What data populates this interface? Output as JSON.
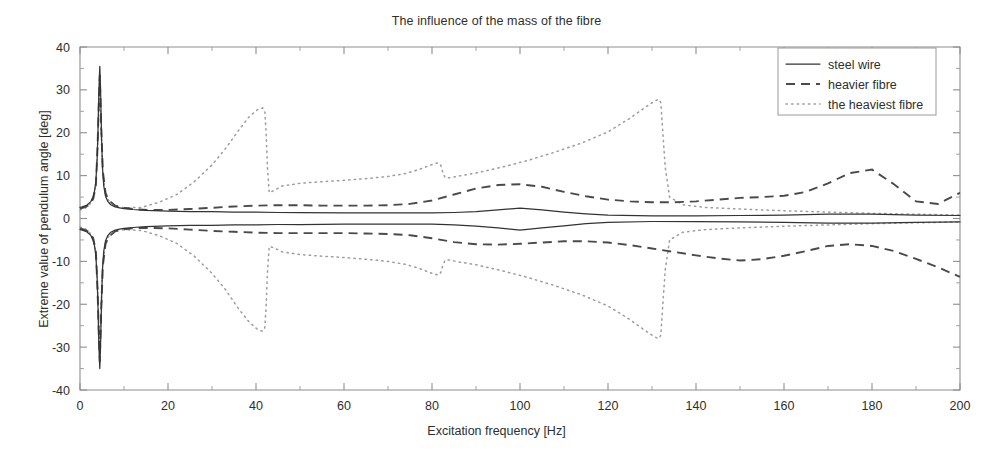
{
  "chart_data": {
    "type": "line",
    "title": "The influence of the mass of the fibre",
    "xlabel": "Excitation frequency [Hz]",
    "ylabel": "Extreme value of pendulum angle [deg]",
    "xlim": [
      0,
      200
    ],
    "ylim": [
      -40,
      40
    ],
    "xticks": [
      0,
      20,
      40,
      60,
      80,
      100,
      120,
      140,
      160,
      180,
      200
    ],
    "xtick_labels": [
      "0",
      "20",
      "40",
      "60",
      "80",
      "100",
      "120",
      "140",
      "160",
      "180",
      "200"
    ],
    "yticks": [
      -40,
      -30,
      -20,
      -10,
      0,
      10,
      20,
      30,
      40
    ],
    "ytick_labels": [
      "-40",
      "-30",
      "-20",
      "-10",
      "0",
      "10",
      "20",
      "30",
      "40"
    ],
    "grid": false,
    "legend_position": "top-right",
    "legend_entries": [
      {
        "label": "steel wire",
        "style": "solid",
        "color": "#333333"
      },
      {
        "label": "heavier fibre",
        "style": "dashed",
        "color": "#4a4a4a"
      },
      {
        "label": "the heaviest fibre",
        "style": "dotted",
        "color": "#9d9d9d"
      }
    ],
    "note": "Each fibre has an upper (maximum) and lower (minimum) extreme-value branch; all three share a sharp resonance spike near 4.5 Hz reaching about +-35 deg.",
    "series": [
      {
        "name": "steel wire",
        "branch": "upper",
        "style": "solid",
        "x": [
          0,
          0.5,
          1,
          1.5,
          2,
          2.5,
          3,
          3.3,
          3.6,
          3.9,
          4.1,
          4.3,
          4.5,
          4.7,
          4.9,
          5.1,
          5.4,
          5.8,
          6.3,
          7,
          8,
          9,
          10,
          12,
          15,
          20,
          25,
          30,
          35,
          40,
          45,
          50,
          60,
          70,
          80,
          85,
          90,
          95,
          100,
          105,
          110,
          115,
          120,
          130,
          140,
          150,
          160,
          170,
          180,
          190,
          200
        ],
        "y": [
          2.6,
          2.7,
          2.9,
          3.1,
          3.5,
          4.0,
          5.2,
          6.4,
          8.6,
          14.0,
          21.0,
          30.0,
          35.5,
          29.0,
          19.0,
          12.0,
          7.6,
          5.2,
          4.0,
          3.2,
          2.7,
          2.5,
          2.3,
          2.1,
          1.9,
          1.7,
          1.6,
          1.6,
          1.5,
          1.5,
          1.4,
          1.4,
          1.3,
          1.3,
          1.3,
          1.4,
          1.6,
          2.0,
          2.4,
          2.0,
          1.5,
          1.1,
          0.8,
          0.6,
          0.6,
          0.7,
          0.8,
          1.0,
          1.0,
          0.8,
          0.7
        ]
      },
      {
        "name": "steel wire",
        "branch": "lower",
        "style": "solid",
        "x": [
          0,
          0.5,
          1,
          1.5,
          2,
          2.5,
          3,
          3.3,
          3.6,
          3.9,
          4.1,
          4.3,
          4.5,
          4.7,
          4.9,
          5.1,
          5.4,
          5.8,
          6.3,
          7,
          8,
          9,
          10,
          12,
          15,
          20,
          25,
          30,
          35,
          40,
          45,
          50,
          60,
          70,
          80,
          85,
          90,
          95,
          100,
          105,
          110,
          115,
          120,
          130,
          140,
          150,
          160,
          170,
          180,
          190,
          200
        ],
        "y": [
          -2.6,
          -2.7,
          -2.9,
          -3.1,
          -3.5,
          -4.0,
          -5.2,
          -6.4,
          -8.6,
          -14.0,
          -21.0,
          -30.0,
          -35.0,
          -28.5,
          -19.0,
          -12.0,
          -7.6,
          -5.2,
          -4.0,
          -3.2,
          -2.7,
          -2.5,
          -2.3,
          -2.1,
          -1.9,
          -1.7,
          -1.6,
          -1.6,
          -1.5,
          -1.5,
          -1.4,
          -1.4,
          -1.3,
          -1.3,
          -1.3,
          -1.5,
          -1.8,
          -2.2,
          -2.7,
          -2.2,
          -1.7,
          -1.2,
          -0.9,
          -0.7,
          -0.7,
          -0.8,
          -0.9,
          -1.1,
          -1.1,
          -0.9,
          -0.8
        ]
      },
      {
        "name": "heavier fibre",
        "branch": "upper",
        "style": "dashed",
        "x": [
          0,
          1,
          2,
          3,
          3.6,
          4.0,
          4.3,
          4.5,
          4.8,
          5.2,
          5.8,
          6.5,
          8,
          10,
          13,
          16,
          20,
          25,
          30,
          35,
          40,
          45,
          50,
          55,
          60,
          65,
          70,
          75,
          80,
          85,
          90,
          95,
          100,
          105,
          110,
          115,
          120,
          125,
          130,
          135,
          140,
          145,
          150,
          155,
          160,
          165,
          170,
          175,
          180,
          185,
          190,
          195,
          200
        ],
        "y": [
          2.3,
          2.6,
          3.1,
          4.6,
          7.5,
          17.0,
          28.0,
          33.5,
          22.0,
          11.0,
          6.0,
          4.3,
          3.0,
          2.5,
          2.1,
          2.0,
          2.0,
          2.2,
          2.5,
          2.8,
          3.0,
          3.1,
          3.1,
          3.0,
          3.0,
          3.0,
          3.1,
          3.4,
          4.2,
          5.6,
          7.0,
          7.8,
          8.0,
          7.4,
          6.2,
          5.2,
          4.4,
          4.0,
          3.8,
          3.8,
          4.0,
          4.4,
          4.8,
          5.0,
          5.3,
          6.2,
          8.2,
          10.6,
          11.4,
          8.0,
          4.0,
          3.4,
          6.0
        ]
      },
      {
        "name": "heavier fibre",
        "branch": "lower",
        "style": "dashed",
        "x": [
          0,
          1,
          2,
          3,
          3.6,
          4.0,
          4.3,
          4.5,
          4.8,
          5.2,
          5.8,
          6.5,
          8,
          10,
          13,
          16,
          20,
          25,
          30,
          35,
          40,
          45,
          50,
          55,
          60,
          65,
          70,
          75,
          80,
          85,
          90,
          95,
          100,
          105,
          110,
          115,
          120,
          125,
          130,
          135,
          140,
          145,
          150,
          155,
          160,
          165,
          170,
          175,
          180,
          185,
          190,
          195,
          200
        ],
        "y": [
          -2.3,
          -2.6,
          -3.1,
          -4.6,
          -7.5,
          -17.0,
          -28.0,
          -33.5,
          -22.0,
          -11.0,
          -6.0,
          -4.3,
          -3.0,
          -2.5,
          -2.2,
          -2.2,
          -2.3,
          -2.6,
          -2.9,
          -3.1,
          -3.3,
          -3.4,
          -3.4,
          -3.4,
          -3.4,
          -3.5,
          -3.6,
          -3.9,
          -4.6,
          -5.5,
          -6.0,
          -6.1,
          -5.9,
          -5.6,
          -5.3,
          -5.3,
          -5.6,
          -6.2,
          -7.0,
          -7.8,
          -8.6,
          -9.3,
          -9.8,
          -9.5,
          -8.7,
          -7.6,
          -6.4,
          -6.0,
          -6.4,
          -7.6,
          -9.4,
          -11.4,
          -13.6
        ]
      },
      {
        "name": "the heaviest fibre",
        "branch": "upper",
        "style": "dotted",
        "x": [
          0,
          1,
          2,
          3,
          3.6,
          4.0,
          4.3,
          4.5,
          4.8,
          5.2,
          5.8,
          6.5,
          8,
          10,
          14,
          18,
          22,
          26,
          30,
          33,
          36,
          38.5,
          40.5,
          41.5,
          42,
          42.3,
          42.6,
          43,
          44,
          46,
          50,
          55,
          60,
          65,
          70,
          74,
          77,
          79,
          80.5,
          81.5,
          82,
          82.5,
          83,
          84,
          86,
          90,
          96,
          102,
          108,
          114,
          120,
          125,
          128,
          130,
          131,
          131.6,
          132,
          132.4,
          133,
          134,
          137,
          142,
          150,
          160,
          170,
          180,
          190,
          200
        ],
        "y": [
          2.0,
          2.3,
          3.0,
          4.5,
          7.8,
          16.5,
          26.0,
          31.0,
          20.0,
          10.5,
          5.8,
          4.2,
          3.0,
          2.5,
          2.6,
          3.8,
          5.6,
          8.6,
          12.5,
          16.2,
          20.5,
          23.8,
          25.5,
          25.8,
          25.0,
          20.0,
          12.0,
          6.0,
          6.5,
          7.6,
          8.2,
          8.6,
          8.9,
          9.3,
          9.8,
          10.5,
          11.4,
          12.2,
          12.8,
          13.0,
          12.4,
          10.6,
          9.5,
          9.5,
          9.9,
          10.6,
          12.0,
          13.6,
          15.5,
          17.6,
          20.2,
          23.4,
          25.6,
          27.0,
          27.6,
          27.8,
          27.0,
          21.0,
          12.0,
          5.0,
          3.2,
          2.6,
          2.2,
          1.8,
          1.5,
          1.2,
          1.0,
          0.8
        ]
      },
      {
        "name": "the heaviest fibre",
        "branch": "lower",
        "style": "dotted",
        "x": [
          0,
          1,
          2,
          3,
          3.6,
          4.0,
          4.3,
          4.5,
          4.8,
          5.2,
          5.8,
          6.5,
          8,
          10,
          14,
          18,
          22,
          26,
          30,
          33,
          36,
          38.5,
          40.5,
          41.5,
          42,
          42.3,
          42.6,
          43,
          44,
          46,
          50,
          55,
          60,
          65,
          70,
          74,
          77,
          79,
          80.5,
          81.5,
          82,
          82.5,
          83,
          84,
          86,
          90,
          96,
          102,
          108,
          114,
          120,
          125,
          128,
          130,
          131,
          131.6,
          132,
          132.4,
          133,
          134,
          137,
          142,
          150,
          160,
          170,
          180,
          190,
          200
        ],
        "y": [
          -2.0,
          -2.3,
          -3.0,
          -4.5,
          -7.8,
          -16.5,
          -26.0,
          -31.0,
          -20.0,
          -10.5,
          -5.8,
          -4.2,
          -3.0,
          -2.6,
          -2.8,
          -4.0,
          -5.8,
          -8.8,
          -12.8,
          -16.5,
          -21.0,
          -24.2,
          -26.0,
          -26.3,
          -25.5,
          -20.5,
          -12.5,
          -6.5,
          -6.8,
          -7.8,
          -8.4,
          -8.8,
          -9.1,
          -9.5,
          -10.0,
          -10.7,
          -11.6,
          -12.4,
          -13.0,
          -13.2,
          -12.6,
          -10.8,
          -9.7,
          -9.7,
          -10.1,
          -10.8,
          -12.2,
          -13.8,
          -15.7,
          -17.8,
          -20.4,
          -23.6,
          -25.8,
          -27.2,
          -27.8,
          -28.0,
          -27.2,
          -21.0,
          -12.0,
          -5.0,
          -3.2,
          -2.6,
          -2.2,
          -1.8,
          -1.5,
          -1.2,
          -1.0,
          -0.8
        ]
      }
    ]
  },
  "figure": {
    "title": "The influence of the mass of the fibre",
    "xlabel": "Excitation frequency [Hz]",
    "ylabel": "Extreme value of pendulum angle [deg]"
  },
  "legend": {
    "item0": "steel wire",
    "item1": "heavier fibre",
    "item2": "the heaviest fibre"
  },
  "colors": {
    "solid": "#333333",
    "dashed": "#4a4a4a",
    "dotted": "#9d9d9d",
    "axis": "#8e8e8e",
    "background": "#ffffff"
  }
}
